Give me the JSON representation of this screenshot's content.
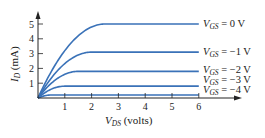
{
  "chart_data": {
    "type": "line",
    "title": "",
    "xlabel": "V_DS (volts)",
    "ylabel": "I_D (mA)",
    "xlabel_parts": {
      "main": "V",
      "sub": "DS",
      "rest": " (volts)"
    },
    "ylabel_parts": {
      "main": "I",
      "sub": "D",
      "rest": " (mA)"
    },
    "xlim": [
      0,
      7.5
    ],
    "ylim": [
      0,
      5.8
    ],
    "x_ticks": [
      1,
      2,
      3,
      4,
      5,
      6
    ],
    "y_ticks": [
      1,
      2,
      3,
      4,
      5
    ],
    "grid": false,
    "legend_position": "right, inline at end of each curve",
    "curve_color": "#3a72b8",
    "series": [
      {
        "name": "V_GS = 0 V",
        "label_main": "V",
        "label_sub": "GS",
        "label_rest": " = 0 V",
        "saturation_current": 5.0,
        "knee_vds": 2.5,
        "x": [
          0,
          0.5,
          1,
          1.5,
          2,
          2.5,
          3,
          4,
          5,
          6
        ],
        "values": [
          0,
          2.7,
          4.0,
          4.6,
          4.85,
          4.95,
          5.0,
          5.0,
          5.0,
          5.0
        ]
      },
      {
        "name": "V_GS = -1 V",
        "label_main": "V",
        "label_sub": "GS",
        "label_rest": " = −1 V",
        "saturation_current": 3.1,
        "knee_vds": 2.0,
        "x": [
          0,
          0.5,
          1,
          1.5,
          2,
          2.5,
          3,
          4,
          5,
          6
        ],
        "values": [
          0,
          1.8,
          2.6,
          2.9,
          3.0,
          3.05,
          3.1,
          3.1,
          3.1,
          3.1
        ]
      },
      {
        "name": "V_GS = -2 V",
        "label_main": "V",
        "label_sub": "GS",
        "label_rest": " = −2 V",
        "saturation_current": 1.8,
        "knee_vds": 1.5,
        "x": [
          0,
          0.5,
          1,
          1.5,
          2,
          2.5,
          3,
          4,
          5,
          6
        ],
        "values": [
          0,
          1.1,
          1.55,
          1.7,
          1.75,
          1.78,
          1.8,
          1.8,
          1.8,
          1.8
        ]
      },
      {
        "name": "V_GS = -3 V",
        "label_main": "V",
        "label_sub": "GS",
        "label_rest": " = −3 V",
        "saturation_current": 0.8,
        "knee_vds": 1.0,
        "x": [
          0,
          0.5,
          1,
          1.5,
          2,
          2.5,
          3,
          4,
          5,
          6
        ],
        "values": [
          0,
          0.6,
          0.75,
          0.78,
          0.8,
          0.8,
          0.8,
          0.8,
          0.8,
          0.8
        ]
      },
      {
        "name": "V_GS = -4 V",
        "label_main": "V",
        "label_sub": "GS",
        "label_rest": " = −4 V",
        "saturation_current": 0.2,
        "knee_vds": 0.5,
        "x": [
          0,
          0.5,
          1,
          1.5,
          2,
          2.5,
          3,
          4,
          5,
          6
        ],
        "values": [
          0,
          0.18,
          0.2,
          0.2,
          0.2,
          0.2,
          0.2,
          0.2,
          0.2,
          0.2
        ]
      }
    ]
  }
}
